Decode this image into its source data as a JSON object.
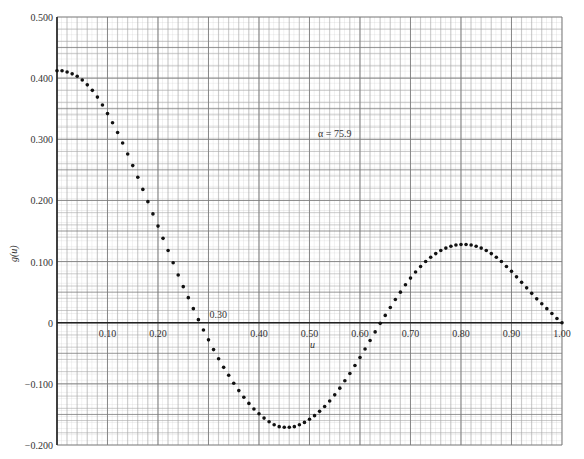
{
  "chart_data": {
    "type": "scatter",
    "title": "",
    "xlabel": "u",
    "ylabel": "g(u)",
    "annotation": "α = 75.9",
    "xlim": [
      0,
      1.0
    ],
    "ylim": [
      -0.2,
      0.5
    ],
    "grid": true,
    "legend": null,
    "x_ticks": [
      "0.10",
      "0.20",
      "0.30",
      "0.40",
      "0.50",
      "0.60",
      "0.70",
      "0.80",
      "0.90",
      "1.00"
    ],
    "y_ticks": [
      "0.500",
      "0.400",
      "0.300",
      "0.200",
      "0.100",
      "0",
      "-0.100",
      "-0.200"
    ],
    "series": [
      {
        "name": "g(u)",
        "x": [
          0.0,
          0.01,
          0.02,
          0.03,
          0.04,
          0.05,
          0.06,
          0.07,
          0.08,
          0.09,
          0.1,
          0.11,
          0.12,
          0.13,
          0.14,
          0.15,
          0.16,
          0.17,
          0.18,
          0.19,
          0.2,
          0.21,
          0.22,
          0.23,
          0.24,
          0.25,
          0.26,
          0.27,
          0.28,
          0.29,
          0.3,
          0.31,
          0.32,
          0.33,
          0.34,
          0.35,
          0.36,
          0.37,
          0.38,
          0.39,
          0.4,
          0.41,
          0.42,
          0.43,
          0.44,
          0.45,
          0.46,
          0.47,
          0.48,
          0.49,
          0.5,
          0.51,
          0.52,
          0.53,
          0.54,
          0.55,
          0.56,
          0.57,
          0.58,
          0.59,
          0.6,
          0.61,
          0.62,
          0.63,
          0.64,
          0.65,
          0.66,
          0.67,
          0.68,
          0.69,
          0.7,
          0.71,
          0.72,
          0.73,
          0.74,
          0.75,
          0.76,
          0.77,
          0.78,
          0.79,
          0.8,
          0.81,
          0.82,
          0.83,
          0.84,
          0.85,
          0.86,
          0.87,
          0.88,
          0.89,
          0.9,
          0.91,
          0.92,
          0.93,
          0.94,
          0.95,
          0.96,
          0.97,
          0.98,
          0.99,
          1.0
        ],
        "y": [
          0.412,
          0.412,
          0.41,
          0.407,
          0.403,
          0.397,
          0.389,
          0.38,
          0.369,
          0.356,
          0.342,
          0.327,
          0.311,
          0.294,
          0.276,
          0.257,
          0.238,
          0.218,
          0.198,
          0.178,
          0.158,
          0.138,
          0.118,
          0.098,
          0.078,
          0.059,
          0.041,
          0.023,
          0.005,
          -0.012,
          -0.028,
          -0.044,
          -0.059,
          -0.073,
          -0.086,
          -0.099,
          -0.111,
          -0.122,
          -0.132,
          -0.141,
          -0.149,
          -0.156,
          -0.162,
          -0.167,
          -0.17,
          -0.171,
          -0.171,
          -0.17,
          -0.167,
          -0.163,
          -0.158,
          -0.152,
          -0.145,
          -0.137,
          -0.128,
          -0.118,
          -0.107,
          -0.095,
          -0.083,
          -0.07,
          -0.057,
          -0.043,
          -0.029,
          -0.015,
          -0.001,
          0.012,
          0.025,
          0.038,
          0.05,
          0.062,
          0.073,
          0.083,
          0.092,
          0.1,
          0.107,
          0.113,
          0.118,
          0.122,
          0.125,
          0.127,
          0.128,
          0.128,
          0.127,
          0.125,
          0.122,
          0.118,
          0.113,
          0.107,
          0.1,
          0.092,
          0.084,
          0.075,
          0.066,
          0.057,
          0.048,
          0.039,
          0.031,
          0.023,
          0.015,
          0.007,
          0.0
        ]
      }
    ]
  }
}
